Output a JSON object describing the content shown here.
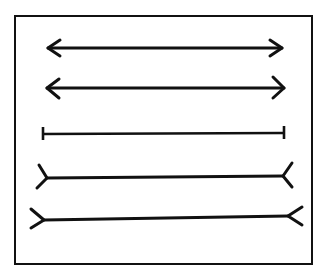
{
  "diagram": {
    "stroke_color": "#111111",
    "background": "#ffffff",
    "frame": {
      "x": 15,
      "y": 16,
      "width": 297,
      "height": 248
    },
    "lines": [
      {
        "id": "arrowheads-inward-1",
        "style": "arrow-in",
        "x1": 47,
        "x2": 282,
        "y": 48
      },
      {
        "id": "arrowheads-inward-2",
        "style": "arrow-in",
        "x1": 46,
        "x2": 284,
        "y": 88
      },
      {
        "id": "plain-ticks",
        "style": "tick",
        "x1": 43,
        "x2": 284,
        "y": 134
      },
      {
        "id": "fins-outward-1",
        "style": "fin-out",
        "x1": 47,
        "x2": 283,
        "y": 178
      },
      {
        "id": "fins-outward-2",
        "style": "fin-out",
        "x1": 44,
        "x2": 288,
        "y": 219
      }
    ]
  }
}
